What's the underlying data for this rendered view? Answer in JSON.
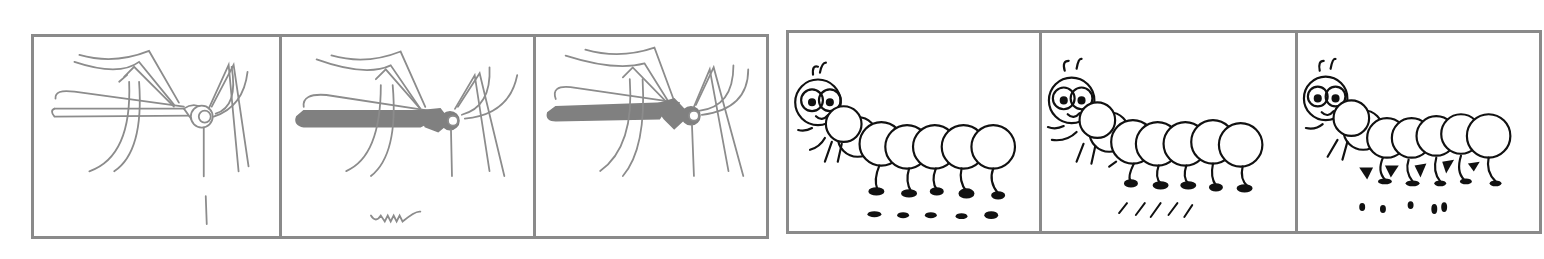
{
  "figure": {
    "strips": [
      {
        "subject": "mosquito",
        "panels": [
          {
            "illustration": "mosquito-outline-icon",
            "body_fill": "none",
            "mark": "vertical-line-mark"
          },
          {
            "illustration": "mosquito-filled-icon",
            "body_fill": "#808080",
            "mark": "zigzag-wave-mark"
          },
          {
            "illustration": "mosquito-filled-icon",
            "body_fill": "#808080",
            "mark": "none"
          }
        ]
      },
      {
        "subject": "caterpillar",
        "panels": [
          {
            "illustration": "caterpillar-icon",
            "mark": "dash-tracks",
            "mark_count": 5
          },
          {
            "illustration": "caterpillar-icon",
            "mark": "slash-tracks",
            "mark_count": 5
          },
          {
            "illustration": "caterpillar-icon",
            "mark": "dot-tracks",
            "mark_count": 5
          }
        ]
      }
    ],
    "colors": {
      "frame": "#8a8a8a",
      "mosquito_line": "#8c8c8c",
      "mosquito_fill": "#808080",
      "caterpillar_line": "#111111",
      "background": "#ffffff"
    }
  }
}
